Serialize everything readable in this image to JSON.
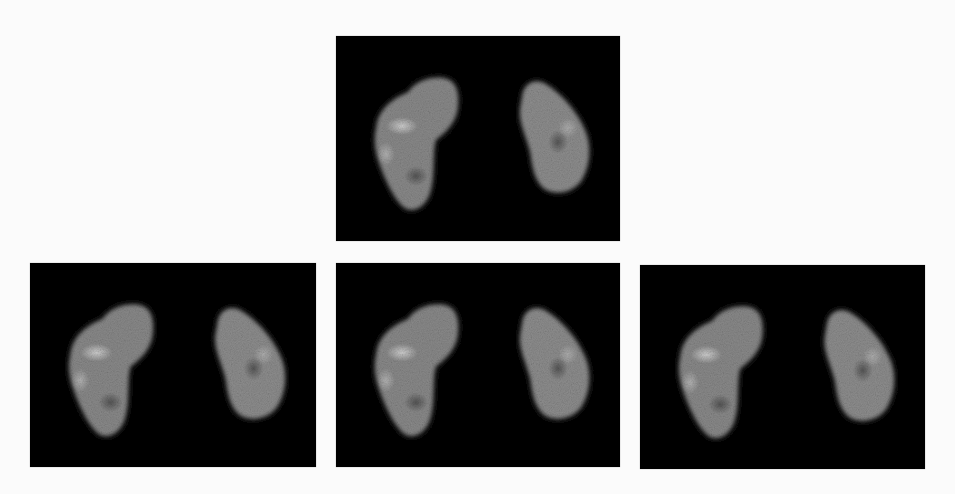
{
  "figure": {
    "background": "#fbfbfb",
    "panels": [
      {
        "id": "top",
        "x": 336,
        "y": 36,
        "w": 284,
        "h": 205
      },
      {
        "id": "bottom-left",
        "x": 30,
        "y": 263,
        "w": 286,
        "h": 204
      },
      {
        "id": "bottom-middle",
        "x": 336,
        "y": 263,
        "w": 284,
        "h": 204
      },
      {
        "id": "bottom-right",
        "x": 640,
        "y": 265,
        "w": 285,
        "h": 204
      }
    ],
    "colors": {
      "panel_bg": "#050505",
      "kidney_tone": "#9a9a9a",
      "hotspot": "#d0d0d0"
    }
  }
}
